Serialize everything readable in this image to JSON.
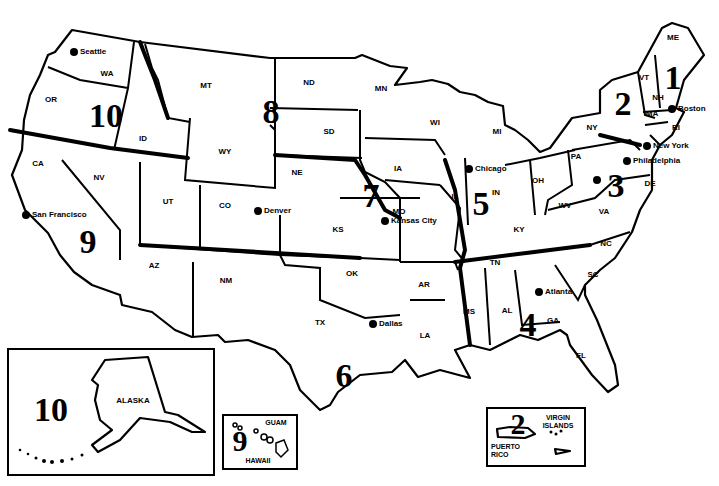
{
  "map": {
    "title": "",
    "states": [
      {
        "abbr": "WA",
        "x": 107,
        "y": 73
      },
      {
        "abbr": "OR",
        "x": 51,
        "y": 99
      },
      {
        "abbr": "ID",
        "x": 143,
        "y": 138
      },
      {
        "abbr": "MT",
        "x": 206,
        "y": 85
      },
      {
        "abbr": "WY",
        "x": 225,
        "y": 151
      },
      {
        "abbr": "CA",
        "x": 38,
        "y": 163
      },
      {
        "abbr": "NV",
        "x": 99,
        "y": 177
      },
      {
        "abbr": "UT",
        "x": 168,
        "y": 201
      },
      {
        "abbr": "CO",
        "x": 225,
        "y": 205
      },
      {
        "abbr": "AZ",
        "x": 154,
        "y": 265
      },
      {
        "abbr": "NM",
        "x": 226,
        "y": 280
      },
      {
        "abbr": "ND",
        "x": 309,
        "y": 82
      },
      {
        "abbr": "SD",
        "x": 329,
        "y": 131
      },
      {
        "abbr": "NE",
        "x": 297,
        "y": 172
      },
      {
        "abbr": "KS",
        "x": 338,
        "y": 229
      },
      {
        "abbr": "OK",
        "x": 352,
        "y": 273
      },
      {
        "abbr": "TX",
        "x": 320,
        "y": 322
      },
      {
        "abbr": "MN",
        "x": 381,
        "y": 88
      },
      {
        "abbr": "IA",
        "x": 398,
        "y": 168
      },
      {
        "abbr": "MO",
        "x": 399,
        "y": 211
      },
      {
        "abbr": "AR",
        "x": 424,
        "y": 284
      },
      {
        "abbr": "LA",
        "x": 425,
        "y": 335
      },
      {
        "abbr": "WI",
        "x": 435,
        "y": 122
      },
      {
        "abbr": "MI",
        "x": 497,
        "y": 131
      },
      {
        "abbr": "IL",
        "x": 455,
        "y": 196
      },
      {
        "abbr": "IN",
        "x": 496,
        "y": 192
      },
      {
        "abbr": "OH",
        "x": 538,
        "y": 180
      },
      {
        "abbr": "KY",
        "x": 519,
        "y": 229
      },
      {
        "abbr": "TN",
        "x": 495,
        "y": 262
      },
      {
        "abbr": "MS",
        "x": 469,
        "y": 311
      },
      {
        "abbr": "AL",
        "x": 507,
        "y": 310
      },
      {
        "abbr": "GA",
        "x": 553,
        "y": 320
      },
      {
        "abbr": "FL",
        "x": 581,
        "y": 355
      },
      {
        "abbr": "SC",
        "x": 593,
        "y": 274
      },
      {
        "abbr": "NC",
        "x": 606,
        "y": 243
      },
      {
        "abbr": "VA",
        "x": 604,
        "y": 211
      },
      {
        "abbr": "WV",
        "x": 565,
        "y": 205
      },
      {
        "abbr": "PA",
        "x": 576,
        "y": 156
      },
      {
        "abbr": "NY",
        "x": 592,
        "y": 127
      },
      {
        "abbr": "VT",
        "x": 644,
        "y": 77
      },
      {
        "abbr": "NH",
        "x": 658,
        "y": 97
      },
      {
        "abbr": "ME",
        "x": 673,
        "y": 37
      },
      {
        "abbr": "MA",
        "x": 652,
        "y": 113
      },
      {
        "abbr": "RI",
        "x": 676,
        "y": 127
      },
      {
        "abbr": "DE",
        "x": 650,
        "y": 183
      }
    ],
    "cities": [
      {
        "name": "Seattle",
        "x": 74,
        "y": 52
      },
      {
        "name": "San Francisco",
        "x": 26,
        "y": 215
      },
      {
        "name": "Denver",
        "x": 258,
        "y": 211
      },
      {
        "name": "Kansas City",
        "x": 385,
        "y": 221
      },
      {
        "name": "Dallas",
        "x": 373,
        "y": 324
      },
      {
        "name": "Chicago",
        "x": 469,
        "y": 169
      },
      {
        "name": "Atlanta",
        "x": 539,
        "y": 292
      },
      {
        "name": "Boston",
        "x": 672,
        "y": 109
      },
      {
        "name": "New York",
        "x": 647,
        "y": 146
      },
      {
        "name": "Philadelphia",
        "x": 627,
        "y": 161
      },
      {
        "name": "Washington DC",
        "x": 597,
        "y": 180
      }
    ],
    "regions": [
      {
        "number": "1",
        "x": 673,
        "y": 78
      },
      {
        "number": "2",
        "x": 623,
        "y": 104
      },
      {
        "number": "3",
        "x": 616,
        "y": 186
      },
      {
        "number": "4",
        "x": 528,
        "y": 325
      },
      {
        "number": "5",
        "x": 481,
        "y": 204
      },
      {
        "number": "6",
        "x": 344,
        "y": 376
      },
      {
        "number": "7",
        "x": 371,
        "y": 196
      },
      {
        "number": "8",
        "x": 271,
        "y": 112
      },
      {
        "number": "9",
        "x": 88,
        "y": 242
      },
      {
        "number": "10",
        "x": 106,
        "y": 116
      }
    ],
    "insets": {
      "alaska": {
        "label": "ALASKA",
        "region": "10"
      },
      "pacific": {
        "label_guam": "GUAM",
        "label_hawaii": "HAWAII",
        "region": "9"
      },
      "caribbean": {
        "label_virgin": "VIRGIN ISLANDS",
        "label_pr": "PUERTO RICO",
        "region": "2"
      }
    }
  }
}
